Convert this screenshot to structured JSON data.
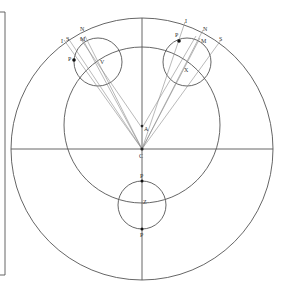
{
  "diagram": {
    "type": "geometric-astronomy-figure",
    "stroke_color": "#555555",
    "thin_stroke_color": "#8a8a8a",
    "outer_circle": {
      "cx": 142,
      "cy": 149,
      "r": 131
    },
    "inner_circle": {
      "cx": 142,
      "cy": 125,
      "r": 78
    },
    "left_box": {
      "x": 0,
      "y": 12,
      "w": 5,
      "h": 263
    },
    "labels": {
      "C": "C",
      "A": "A",
      "Z": "Z",
      "P_top_bottom_circle": "P",
      "P_bottom_bottom_circle": "P",
      "left_N": "N",
      "left_I": "I",
      "left_S": "S",
      "left_M": "M",
      "left_P": "P",
      "left_V": "V",
      "right_I": "I",
      "right_N": "N",
      "right_S": "S",
      "right_M": "M",
      "right_P": "P",
      "right_X": "X"
    },
    "small_circles": [
      {
        "name": "left",
        "cx": 98,
        "cy": 62,
        "r": 24,
        "center_label": "V"
      },
      {
        "name": "right",
        "cx": 187,
        "cy": 62,
        "r": 24,
        "center_label": "X"
      },
      {
        "name": "bottom",
        "cx": 142,
        "cy": 205,
        "r": 24,
        "center_label": "Z"
      }
    ]
  }
}
